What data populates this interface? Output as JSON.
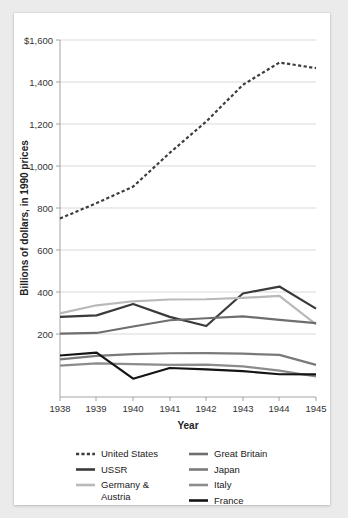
{
  "chart_data": {
    "type": "line",
    "title": "",
    "xlabel": "Year",
    "ylabel": "Billions of dollars, in 1990 prices",
    "x": [
      1938,
      1939,
      1940,
      1941,
      1942,
      1943,
      1944,
      1945
    ],
    "xtick_labels": [
      "1938",
      "1939",
      "1940",
      "1941",
      "1942",
      "1943",
      "1944",
      "1945"
    ],
    "ytick_labels": [
      "$1,600",
      "1,400",
      "1,200",
      "1,000",
      "800",
      "600",
      "400",
      "200"
    ],
    "ytick_values": [
      1600,
      1400,
      1200,
      1000,
      800,
      600,
      400,
      200
    ],
    "ylim": [
      0,
      1600
    ],
    "xlim": [
      1938,
      1945
    ],
    "grid": true,
    "legend_position": "bottom",
    "series": [
      {
        "name": "United States",
        "color": "#3d3d3d",
        "style": "dashed",
        "width": 2.2,
        "values": [
          800,
          869,
          943,
          1094,
          1235,
          1399,
          1499,
          1474
        ]
      },
      {
        "name": "USSR",
        "color": "#3a3a3a",
        "style": "solid",
        "width": 2.2,
        "values": [
          359,
          366,
          417,
          359,
          318,
          464,
          495,
          396
        ]
      },
      {
        "name": "Germany & Austria",
        "color": "#b9b9b9",
        "style": "solid",
        "width": 2.2,
        "values": [
          375,
          411,
          429,
          437,
          438,
          444,
          453,
          325
        ]
      },
      {
        "name": "Great Britain",
        "color": "#6e6e6e",
        "style": "solid",
        "width": 2.2,
        "values": [
          284,
          287,
          316,
          344,
          353,
          361,
          346,
          331
        ]
      },
      {
        "name": "Japan",
        "color": "#7a7a7a",
        "style": "solid",
        "width": 2.2,
        "values": [
          169,
          184,
          192,
          196,
          197,
          194,
          189,
          144
        ]
      },
      {
        "name": "Italy",
        "color": "#8c8c8c",
        "style": "solid",
        "width": 2.2,
        "values": [
          141,
          151,
          147,
          144,
          145,
          137,
          118,
          92
        ]
      },
      {
        "name": "France",
        "color": "#141414",
        "style": "solid",
        "width": 2.2,
        "values": [
          186,
          199,
          82,
          130,
          124,
          116,
          102,
          101
        ]
      }
    ],
    "legend_entries": [
      {
        "label": "United States",
        "color": "#3d3d3d",
        "style": "dashed",
        "column": "left"
      },
      {
        "label": "USSR",
        "color": "#3a3a3a",
        "style": "solid",
        "column": "left"
      },
      {
        "label": "Germany & Austria",
        "color": "#b9b9b9",
        "style": "solid",
        "column": "left"
      },
      {
        "label": "Great Britain",
        "color": "#6e6e6e",
        "style": "solid",
        "column": "right"
      },
      {
        "label": "Japan",
        "color": "#7a7a7a",
        "style": "solid",
        "column": "right"
      },
      {
        "label": "Italy",
        "color": "#8c8c8c",
        "style": "solid",
        "column": "right"
      },
      {
        "label": "France",
        "color": "#141414",
        "style": "solid",
        "column": "right"
      }
    ]
  },
  "legend": {
    "united_states": "United States",
    "ussr": "USSR",
    "germany_line1": "Germany &",
    "germany_line2": "Austria",
    "great_britain": "Great Britain",
    "japan": "Japan",
    "italy": "Italy",
    "france": "France"
  },
  "axes": {
    "y_title": "Billions of dollars, in 1990 prices",
    "x_title": "Year",
    "y_ticks": [
      "$1,600",
      "1,400",
      "1,200",
      "1,000",
      "800",
      "600",
      "400",
      "200"
    ],
    "x_ticks": [
      "1938",
      "1939",
      "1940",
      "1941",
      "1942",
      "1943",
      "1944",
      "1945"
    ]
  }
}
